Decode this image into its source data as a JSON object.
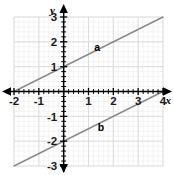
{
  "figure": {
    "title": "",
    "width": 174,
    "height": 175,
    "background_color": "#ffffff"
  },
  "chart_data": {
    "type": "line",
    "title": "",
    "xlabel": "x",
    "ylabel": "y",
    "xlim": [
      -2,
      4
    ],
    "ylim": [
      -3,
      3
    ],
    "grid": true,
    "minor_grid": true,
    "minor_ticks_per_unit": 5,
    "legend_position": "inline-annotation",
    "axis_color": "#000000",
    "grid_color": "#d9d9d9",
    "minor_grid_color": "#ececec",
    "line_color": "#8a8a8a",
    "xticks": [
      -2,
      -1,
      0,
      1,
      2,
      3,
      4
    ],
    "xtick_labels": [
      "-2",
      "-1",
      "",
      "1",
      "2",
      "3",
      "4"
    ],
    "yticks": [
      -3,
      -2,
      -1,
      0,
      1,
      2,
      3
    ],
    "ytick_labels": [
      "-3",
      "-2",
      "-1",
      "",
      "1",
      "2",
      "3"
    ],
    "series": [
      {
        "name": "a",
        "label": "a",
        "label_x": 1.35,
        "label_y": 1.62,
        "slope": 0.5,
        "intercept": 1,
        "equation": "y = 0.5x + 1",
        "x": [
          -2,
          4
        ],
        "values": [
          0,
          3
        ]
      },
      {
        "name": "b",
        "label": "b",
        "label_x": 1.5,
        "label_y": -1.6,
        "slope": 0.5,
        "intercept": -2,
        "equation": "y = 0.5x - 2",
        "x": [
          -2,
          4
        ],
        "values": [
          -3,
          0
        ]
      }
    ]
  }
}
